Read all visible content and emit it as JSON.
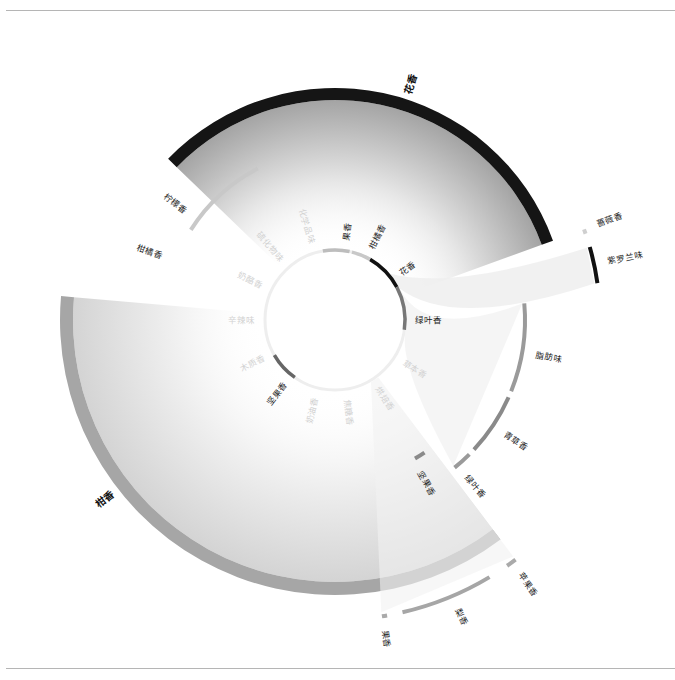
{
  "diagram": {
    "type": "radial-flavor-wheel",
    "center": [
      335,
      320
    ],
    "inner_ring": {
      "radius": 70,
      "base_color": "#eeeeee",
      "segments": [
        {
          "label": "花香",
          "start": 30,
          "end": 62,
          "color": "#111111",
          "faded": false
        },
        {
          "label": "绿叶香",
          "start": 62,
          "end": 98,
          "color": "#777777",
          "faded": false
        },
        {
          "label": "柑橘香",
          "start": 14,
          "end": 30,
          "color": "#c8c8c8",
          "faded": false
        },
        {
          "label": "果香",
          "start": -10,
          "end": 12,
          "color": "#bdbdbd",
          "faded": false
        },
        {
          "label": "坚果香",
          "start": 215,
          "end": 240,
          "color": "#666666",
          "faded": false
        }
      ],
      "labels": [
        {
          "text": "果香",
          "angle": 8,
          "faded": false
        },
        {
          "text": "柑橘香",
          "angle": 27,
          "faded": false
        },
        {
          "text": "花香",
          "angle": 55,
          "faded": false
        },
        {
          "text": "绿叶香",
          "angle": 90,
          "faded": false
        },
        {
          "text": "草本香",
          "angle": 122,
          "faded": true
        },
        {
          "text": "烘焙香",
          "angle": 148,
          "faded": true
        },
        {
          "text": "焦糖香",
          "angle": 172,
          "faded": true
        },
        {
          "text": "奶油香",
          "angle": 194,
          "faded": true
        },
        {
          "text": "坚果香",
          "angle": 218,
          "faded": false
        },
        {
          "text": "木质香",
          "angle": 242,
          "faded": true
        },
        {
          "text": "辛辣味",
          "angle": 270,
          "faded": true
        },
        {
          "text": "奶酪香",
          "angle": 295,
          "faded": true
        },
        {
          "text": "硫化物味",
          "angle": 318,
          "faded": true
        },
        {
          "text": "化学品味",
          "angle": 343,
          "faded": true
        }
      ]
    },
    "groups": [
      {
        "label": "花香",
        "start": -46,
        "end": 70,
        "r_in": 220,
        "r_out": 232,
        "color": "#151515",
        "fill_from": "#9a9a9a",
        "label_angle": 18,
        "label_r": 248
      },
      {
        "label": "柑香",
        "start": 143,
        "end": 275,
        "r_in": 262,
        "r_out": 275,
        "color": "#a6a6a6",
        "fill_from": "#cfcfcf",
        "label_angle": 232,
        "label_r": 292
      }
    ],
    "outer_arcs": [
      {
        "label": "蔷薇香",
        "start": 70,
        "end": 71,
        "r": 265,
        "color": "#cfcfcf",
        "label_angle": 70
      },
      {
        "label": "紫罗兰味",
        "start": 74,
        "end": 82,
        "r": 265,
        "color": "#111111",
        "label_angle": 78
      },
      {
        "label": "脂肪味",
        "start": 85,
        "end": 112,
        "r": 190,
        "color": "#9a9a9a",
        "label_angle": 100
      },
      {
        "label": "青草香",
        "start": 114,
        "end": 133,
        "r": 190,
        "color": "#8a8a8a",
        "label_angle": 124
      },
      {
        "label": "绿叶香",
        "start": 135,
        "end": 141,
        "r": 190,
        "color": "#9a9a9a",
        "label_angle": 140
      },
      {
        "label": "坚果香",
        "start": 146,
        "end": 150,
        "r": 160,
        "color": "#8a8a8a",
        "label_angle": 151
      },
      {
        "label": "柠檬香",
        "start": 302,
        "end": 318,
        "r": 170,
        "color": "#c8c8c8",
        "label_angle": 306
      },
      {
        "label": "柑橘香",
        "start": 318,
        "end": 333,
        "r": 170,
        "color": "#c8c8c8",
        "label_angle": 290
      },
      {
        "label": "苹果香",
        "start": 143,
        "end": 145,
        "r": 300,
        "color": "#aaaaaa",
        "label_angle": 144
      },
      {
        "label": "梨香",
        "start": 149,
        "end": 167,
        "r": 300,
        "color": "#a6a6a6",
        "label_angle": 157
      },
      {
        "label": "果香",
        "start": 170,
        "end": 171,
        "r": 300,
        "color": "#aaaaaa",
        "label_angle": 171
      }
    ]
  }
}
